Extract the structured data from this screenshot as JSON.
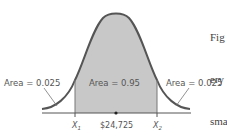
{
  "caption": {
    "lines": [
      "Fig",
      "ery",
      "sma"
    ]
  },
  "diagram": {
    "type": "normal-distribution",
    "colors": {
      "curve": "#555555",
      "shade": "#c8c8c8",
      "axis": "#555555",
      "text": "#555555"
    },
    "regions": {
      "left_tail": {
        "label": "Area = 0.025"
      },
      "center": {
        "label": "Area = 0.95"
      },
      "right_tail": {
        "label": "Area = 0.025"
      }
    },
    "axis_labels": {
      "x1": "X",
      "x1_sub": "1",
      "mean": "$24,725",
      "x2": "X",
      "x2_sub": "2"
    }
  }
}
